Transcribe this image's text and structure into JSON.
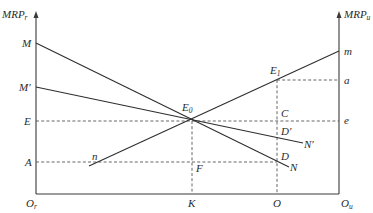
{
  "diagram": {
    "type": "economics-marginal-revenue-product",
    "left_axis": {
      "label": "MRP",
      "subscript": "r",
      "origin_label": "O",
      "origin_subscript": "r"
    },
    "right_axis": {
      "label": "MRP",
      "subscript": "u",
      "origin_label": "O",
      "origin_subscript": "u"
    },
    "left_axis_labels": {
      "M": "M",
      "M_prime": "M′",
      "E": "E",
      "A": "A"
    },
    "right_axis_labels": {
      "m": "m",
      "a": "a",
      "e": "e"
    },
    "points": {
      "E0": "E",
      "E0_sub": "0",
      "E1": "E",
      "E1_sub": "1",
      "C": "C",
      "D_prime": "D′",
      "D": "D",
      "F": "F",
      "n": "n",
      "N": "N",
      "N_prime": "N′"
    },
    "bottom_labels": {
      "K": "K",
      "O": "O"
    },
    "lines": [
      {
        "name": "MN",
        "from": "M",
        "to": "N",
        "style": "solid"
      },
      {
        "name": "M'N'",
        "from": "M′",
        "to": "N′",
        "style": "solid"
      },
      {
        "name": "nm",
        "from": "n",
        "to": "m",
        "style": "solid"
      },
      {
        "name": "E-e",
        "style": "dashed",
        "horizontal": true
      },
      {
        "name": "A-D",
        "style": "dashed",
        "horizontal": true
      },
      {
        "name": "E1-a",
        "style": "dashed",
        "horizontal": true
      },
      {
        "name": "E0-K",
        "style": "dashed",
        "vertical": true
      },
      {
        "name": "E1-O",
        "style": "dashed",
        "vertical": true
      }
    ]
  }
}
